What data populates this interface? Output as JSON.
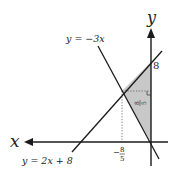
{
  "diagram": {
    "axes": {
      "x_label": "x",
      "y_label": "y",
      "x_direction": "left"
    },
    "lines": [
      {
        "label": "y = −3x",
        "equation": "y = -3x"
      },
      {
        "label": "y = 2x + 8",
        "equation": "y = 2x + 8"
      }
    ],
    "marks": {
      "y_intercept": "8",
      "x_intersection_num": "8",
      "x_intersection_den": "5",
      "x_intersection_sign": "−",
      "height_num": "8",
      "height_den": "5"
    },
    "shaded_region": "triangle bounded by y = 2x + 8, y = -3x, and the y-axis",
    "colors": {
      "shade": "#c8c8c8",
      "line": "#1a1a1a",
      "guide": "#555555"
    }
  }
}
